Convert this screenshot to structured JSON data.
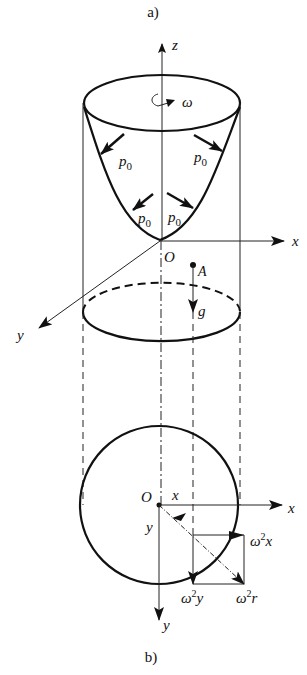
{
  "figure": {
    "caption_a": "a)",
    "caption_b": "b)"
  },
  "part_a": {
    "axes": {
      "z": "z",
      "x": "x",
      "y": "y"
    },
    "origin": "O",
    "rotation": "ω",
    "pressure_labels": [
      "p",
      "p",
      "p",
      "p"
    ],
    "pressure_subscript": "0",
    "point": "A",
    "gravity": "g"
  },
  "part_b": {
    "origin": "O",
    "axes": {
      "x": "x",
      "y": "y"
    },
    "coord_x": "x",
    "coord_y": "y",
    "acc_x": {
      "base": "ω",
      "exp": "2",
      "var": "x"
    },
    "acc_y": {
      "base": "ω",
      "exp": "2",
      "var": "y"
    },
    "acc_r": {
      "base": "ω",
      "exp": "2",
      "var": "r"
    }
  }
}
